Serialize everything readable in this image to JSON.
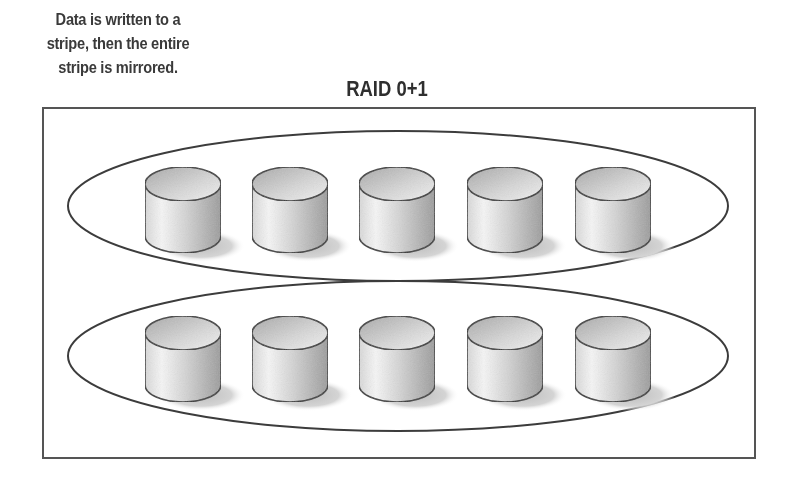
{
  "caption": {
    "lines": [
      "Data is written to a",
      "stripe, then the entire",
      "stripe is mirrored."
    ]
  },
  "title": "RAID 0+1",
  "colors": {
    "stroke": "#3c3c3c",
    "text": "#333333",
    "disk_light": "#f4f4f4",
    "disk_dark": "#9a9a9a",
    "shadow": "#c8c8c8"
  },
  "diagram": {
    "outer_box": {
      "x": 43,
      "y": 108,
      "width": 712,
      "height": 350
    },
    "groups": [
      {
        "name": "stripe-set-primary",
        "disk_count": 5,
        "center_y": 206
      },
      {
        "name": "stripe-set-mirror",
        "disk_count": 5,
        "center_y": 357
      }
    ],
    "disk_positions_x": [
      183,
      290,
      397,
      505,
      613
    ]
  }
}
